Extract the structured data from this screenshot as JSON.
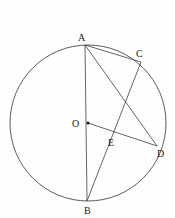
{
  "figure": {
    "canvas": {
      "width": 175,
      "height": 218,
      "background": "#fefefe"
    },
    "stroke_color": "#4a4a4a",
    "label_color": "#1a1a1a",
    "circle": {
      "label": "circle",
      "cx": 88,
      "cy": 123,
      "r": 78
    },
    "points": [
      {
        "id": "A",
        "label": "A",
        "x": 85,
        "y": 45,
        "label_x": 78,
        "label_y": 41,
        "marked": false
      },
      {
        "id": "B",
        "label": "B",
        "x": 87,
        "y": 201,
        "label_x": 84,
        "label_y": 214,
        "marked": false
      },
      {
        "id": "C",
        "label": "C",
        "x": 141,
        "y": 62,
        "label_x": 136,
        "label_y": 57,
        "marked": false
      },
      {
        "id": "D",
        "label": "D",
        "x": 157,
        "y": 146,
        "label_x": 157,
        "label_y": 157,
        "marked": false
      },
      {
        "id": "E",
        "label": "E",
        "x": 112,
        "y": 133,
        "label_x": 108,
        "label_y": 146,
        "marked": false
      },
      {
        "id": "O",
        "label": "O",
        "x": 88,
        "y": 123,
        "label_x": 72,
        "label_y": 127,
        "marked": true
      }
    ],
    "segments": [
      {
        "id": "AB",
        "label": "A-B",
        "from": "A",
        "to": "B"
      },
      {
        "id": "AC",
        "label": "A-C",
        "from": "A",
        "to": "C"
      },
      {
        "id": "AD",
        "label": "A-D",
        "from": "A",
        "to": "D"
      },
      {
        "id": "CB",
        "label": "C-B",
        "from": "C",
        "to": "B"
      },
      {
        "id": "OD",
        "label": "O-D",
        "from": "O",
        "to": "D"
      }
    ]
  },
  "header": {
    "note": "partially cropped vertical japanese text at top edge",
    "columns": [
      {
        "id": "col-1",
        "text": "り、",
        "x": 9,
        "faint": false
      },
      {
        "id": "col-2",
        "text": "る",
        "x": 22,
        "faint": true
      },
      {
        "id": "col-3",
        "text": "のこ",
        "x": 34,
        "faint": false
      },
      {
        "id": "col-4",
        "text": "点",
        "x": 50,
        "faint": true
      },
      {
        "id": "col-5",
        "text": "とい",
        "x": 104,
        "faint": false
      },
      {
        "id": "col-6",
        "text": "交わ",
        "x": 121,
        "faint": false
      },
      {
        "id": "col-7",
        "text": "のと",
        "x": 137,
        "faint": true
      },
      {
        "id": "col-8",
        "text": "り、",
        "x": 153,
        "faint": false
      }
    ]
  }
}
